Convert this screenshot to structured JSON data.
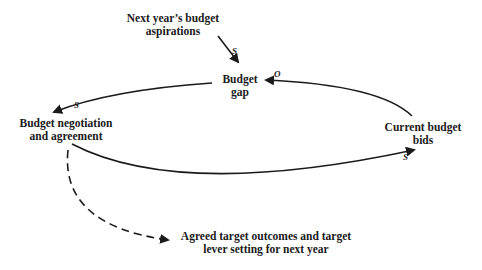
{
  "nodes": {
    "aspirations": {
      "line1": "Next year’s budget",
      "line2": "aspirations"
    },
    "budget_gap": {
      "line1": "Budget",
      "line2": "gap"
    },
    "negotiation": {
      "line1": "Budget negotiation",
      "line2": "and agreement"
    },
    "current_bids": {
      "line1": "Current budget",
      "line2": "bids"
    },
    "agreed_targets": {
      "line1": "Agreed target outcomes and target",
      "line2": "lever setting for next year"
    }
  },
  "links": [
    {
      "from": "Next year’s budget aspirations",
      "to": "Budget gap",
      "polarity": "S",
      "style": "solid"
    },
    {
      "from": "Current budget bids",
      "to": "Budget gap",
      "polarity": "O",
      "style": "solid"
    },
    {
      "from": "Budget gap",
      "to": "Budget negotiation and agreement",
      "polarity": "S",
      "style": "solid"
    },
    {
      "from": "Budget negotiation and agreement",
      "to": "Current budget bids",
      "polarity": "S",
      "style": "solid"
    },
    {
      "from": "Budget negotiation and agreement",
      "to": "Agreed target outcomes and target lever setting for next year",
      "polarity": "",
      "style": "dashed"
    }
  ],
  "polarity_labels": {
    "aspirations_to_gap": "S",
    "bids_to_gap": "O",
    "gap_to_negotiation": "S",
    "negotiation_to_bids": "S"
  },
  "colors": {
    "line": "#1a1a1a",
    "background": "#ffffff"
  }
}
